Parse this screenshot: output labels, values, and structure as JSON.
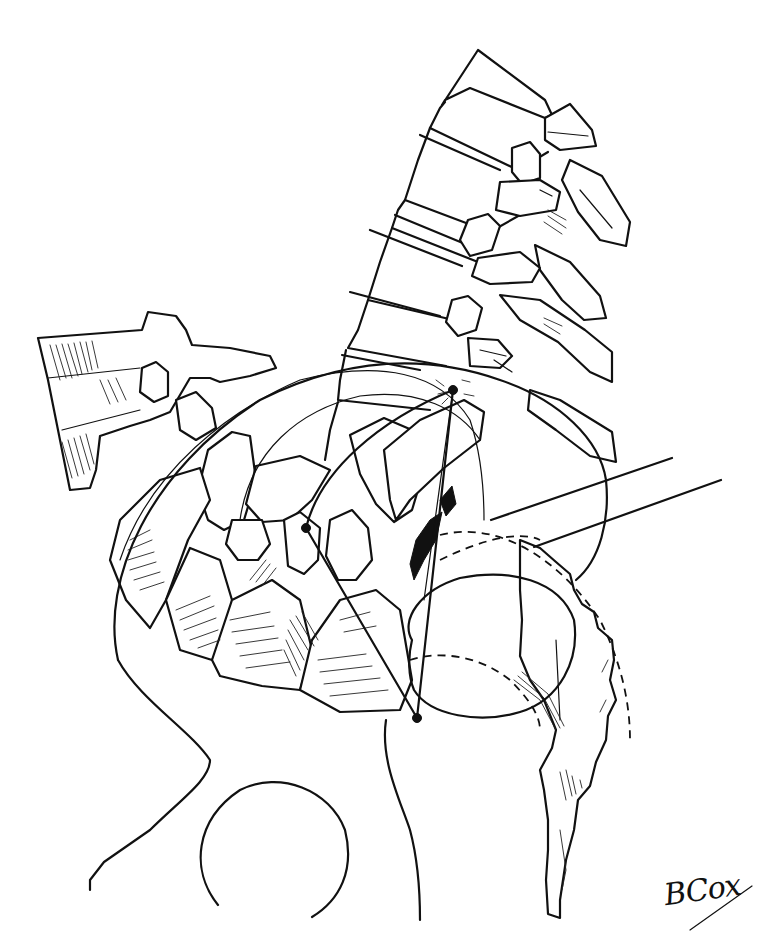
{
  "figure": {
    "type": "anatomical line illustration",
    "signature": "BCox",
    "reference_points": [
      {
        "name": "upper-point",
        "x": 453,
        "y": 390
      },
      {
        "name": "posterior-point",
        "x": 306,
        "y": 528
      },
      {
        "name": "lower-point",
        "x": 417,
        "y": 718
      }
    ],
    "leader_lines": [
      {
        "name": "leader-line-1",
        "from": [
          491,
          520
        ],
        "to": [
          672,
          458
        ]
      },
      {
        "name": "leader-line-2",
        "from": [
          534,
          547
        ],
        "to": [
          721,
          480
        ]
      }
    ],
    "colors": {
      "ink": "#111111",
      "background": "#ffffff"
    }
  }
}
